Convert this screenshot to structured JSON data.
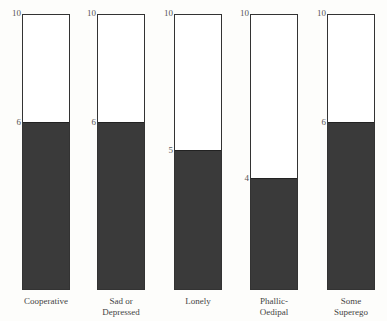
{
  "chart_data": {
    "type": "bar",
    "title": "",
    "xlabel": "",
    "ylabel": "",
    "ylim": [
      0,
      10
    ],
    "categories": [
      "Cooperative",
      "Sad or Depressed",
      "Lonely",
      "Phallic-Oedipal",
      "Some Superego"
    ],
    "values": [
      6,
      6,
      5,
      4,
      6
    ],
    "max_labels": [
      "10",
      "10",
      "10",
      "10",
      "10"
    ],
    "value_labels": [
      "6",
      "6",
      "5",
      "4",
      "6"
    ],
    "label_lines": [
      [
        "Cooperative"
      ],
      [
        "Sad or",
        "Depressed"
      ],
      [
        "Lonely"
      ],
      [
        "Phallic-",
        "Oedipal"
      ],
      [
        "Some",
        "Superego"
      ]
    ],
    "grid": false,
    "legend": "none"
  },
  "colors": {
    "fill": "#3a3a3a",
    "outline": "#333333",
    "background": "#fdfdfb"
  }
}
